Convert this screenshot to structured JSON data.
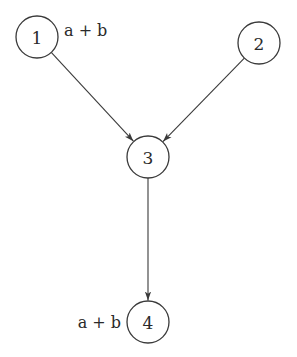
{
  "diagram": {
    "type": "directed-graph",
    "nodes": [
      {
        "id": "1",
        "label": "1",
        "cx": 37,
        "cy": 37,
        "r": 21,
        "annotation": "a + b",
        "annotation_side": "right"
      },
      {
        "id": "2",
        "label": "2",
        "cx": 259,
        "cy": 43,
        "r": 21,
        "annotation": "",
        "annotation_side": ""
      },
      {
        "id": "3",
        "label": "3",
        "cx": 148,
        "cy": 157,
        "r": 21,
        "annotation": "",
        "annotation_side": ""
      },
      {
        "id": "4",
        "label": "4",
        "cx": 148,
        "cy": 322,
        "r": 21,
        "annotation": "a + b",
        "annotation_side": "left"
      }
    ],
    "edges": [
      {
        "from": "1",
        "to": "3"
      },
      {
        "from": "2",
        "to": "3"
      },
      {
        "from": "3",
        "to": "4"
      }
    ],
    "colors": {
      "stroke": "#3a3a3a",
      "text": "#2a2a2a",
      "background": "#ffffff"
    }
  }
}
